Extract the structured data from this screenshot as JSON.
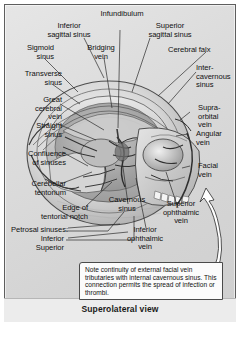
{
  "figure": {
    "caption": "Superolateral view",
    "style": "grayscale anatomical illustration"
  },
  "labels": {
    "top": [
      {
        "id": "inferior-sagittal-sinus",
        "text": "Inferior\nsagittal sinus"
      },
      {
        "id": "infundibulum",
        "text": "Infundibulum"
      },
      {
        "id": "superior-sagittal-sinus",
        "text": "Superior\nsagittal sinus"
      },
      {
        "id": "bridging-vein",
        "text": "Bridging\nvein"
      },
      {
        "id": "cerebral-falx",
        "text": "Cerebral falx"
      }
    ],
    "left": [
      {
        "id": "sigmoid-sinus",
        "text": "Sigmoid\nsinus"
      },
      {
        "id": "transverse-sinus",
        "text": "Transverse\nsinus"
      },
      {
        "id": "great-cerebral-vein",
        "text": "Great\ncerebral\nvein"
      },
      {
        "id": "straight-sinus",
        "text": "Straight\nsinus"
      },
      {
        "id": "confluence-of-sinuses",
        "text": "Confluence\nof sinuses"
      },
      {
        "id": "cerebellar-tentorium",
        "text": "Cerebellar\ntentorium"
      },
      {
        "id": "edge-of-tentorial-notch",
        "text": "Edge of\ntentorial notch"
      },
      {
        "id": "petrosal-sinuses",
        "text": "Petrosal sinuses:"
      },
      {
        "id": "petrosal-inferior",
        "text": "Inferior"
      },
      {
        "id": "petrosal-superior",
        "text": "Superior"
      }
    ],
    "right": [
      {
        "id": "intercavernous-sinus",
        "text": "Inter-\ncavernous\nsinus"
      },
      {
        "id": "supraorbital-vein",
        "text": "Supra-\norbital\nvein"
      },
      {
        "id": "angular-vein",
        "text": "Angular\nvein"
      },
      {
        "id": "facial-vein",
        "text": "Facial\nvein"
      }
    ],
    "lower": [
      {
        "id": "cavernous-sinus",
        "text": "Cavernous\nsinus"
      },
      {
        "id": "superior-ophthalmic-vein",
        "text": "Superior\nophthalmic\nvein"
      },
      {
        "id": "inferior-ophthalmic-vein",
        "text": "Inferior\nophthalmic\nvein"
      }
    ]
  },
  "note": {
    "text": "Note continuity of external facial vein tributaries with internal cavernous sinus. This connection permits the spread of infection or thrombi."
  },
  "colors": {
    "plate_background": "#dcdcdc",
    "frame_border": "#5e5e5e",
    "label_text": "#111111",
    "note_background": "#fbfbfb",
    "note_border": "#4a4a4a",
    "leader_line": "#2b2b2b",
    "arrow_fill": "#ffffff"
  }
}
